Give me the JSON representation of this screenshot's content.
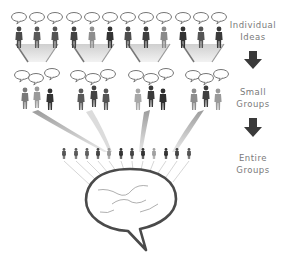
{
  "diagram": {
    "stages": [
      {
        "id": "individual",
        "label_line1": "Individual",
        "label_line2": "Ideas",
        "groups": 4,
        "people_per_group": 3
      },
      {
        "id": "small",
        "label_line1": "Small",
        "label_line2": "Groups",
        "groups": 4,
        "people_per_group": 3
      },
      {
        "id": "entire",
        "label_line1": "Entire",
        "label_line2": "Groups",
        "people": 12
      }
    ],
    "arrows": [
      "down-arrow",
      "down-arrow"
    ],
    "central_icon": "speech-bubble-icon",
    "caption": "",
    "colors": {
      "figure_dark": "#3d3d3d",
      "figure_mid": "#5e5e5e",
      "figure_light": "#9a9a9a",
      "funnel": "#d6d6d6",
      "arrow": "#3a3a3a",
      "label_text": "#7a7a7a",
      "bubble_outline": "#4a4a4a"
    }
  }
}
